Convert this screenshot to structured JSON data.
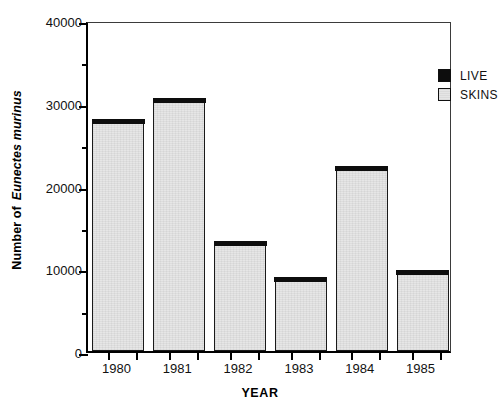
{
  "chart_data": {
    "type": "bar",
    "title": "",
    "subtitle": "",
    "xlabel": "YEAR",
    "ylabel_prefix": "Number of",
    "ylabel_italic": "Eunectes murinus",
    "ylabel": "Number of Eunectes murinus",
    "categories": [
      "1980",
      "1981",
      "1982",
      "1983",
      "1984",
      "1985"
    ],
    "series": [
      {
        "name": "SKINS",
        "values": [
          27500,
          30000,
          12700,
          8400,
          21800,
          9200
        ]
      },
      {
        "name": "LIVE",
        "values": [
          500,
          500,
          500,
          500,
          500,
          500
        ]
      }
    ],
    "totals": [
      28000,
      30500,
      13200,
      8900,
      22300,
      9700
    ],
    "ylim": [
      0,
      40000
    ],
    "xlim_categories": 6,
    "ytick_values": [
      0,
      10000,
      20000,
      30000,
      40000
    ],
    "ytick_labels": [
      "0",
      "10000",
      "20000",
      "30000",
      "40000"
    ],
    "yminor_values": [
      5000,
      15000,
      25000,
      35000
    ],
    "grid": false,
    "legend_position": "top-right",
    "legend": [
      {
        "label": "LIVE",
        "swatch": "solid-black",
        "color": "#0d0d0d"
      },
      {
        "label": "SKINS",
        "swatch": "light-gray-outlined",
        "color": "#e4e4e4"
      }
    ],
    "colors": {
      "skins_fill": "#e4e4e4",
      "live_fill": "#0d0d0d",
      "bar_outline": "#1a1a1a",
      "axis": "#000000",
      "background": "#ffffff"
    }
  }
}
